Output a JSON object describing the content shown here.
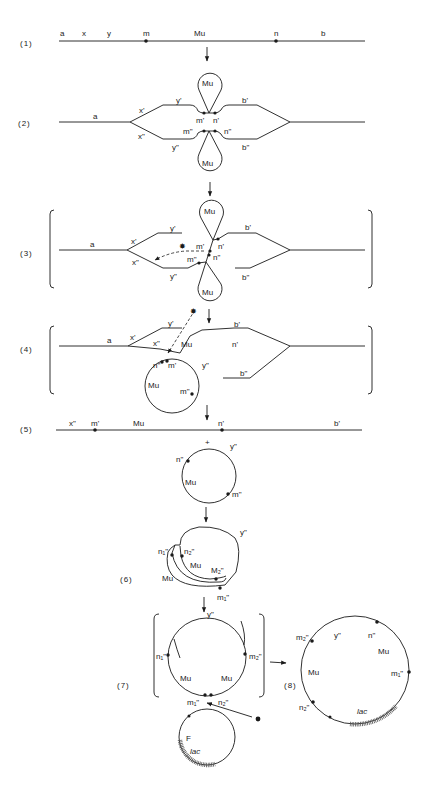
{
  "steps": {
    "s1": "(1)",
    "s2": "(2)",
    "s3": "(3)",
    "s4": "(4)",
    "s5": "(5)",
    "s6": "(6)",
    "s7": "(7)",
    "s8": "(8)"
  },
  "step1": {
    "labels": [
      "a",
      "x",
      "y",
      "m",
      "Mu",
      "n",
      "b"
    ]
  },
  "step2": {
    "mu": "Mu",
    "labels": {
      "a": "a",
      "x1": "x'",
      "y1": "y'",
      "b1": "b'",
      "m1": "m'",
      "n1": "n'",
      "x2": "x\"",
      "y2": "y\"",
      "m2": "m\"",
      "n2": "n\"",
      "b2": "b\""
    }
  },
  "step3": {
    "mu": "Mu",
    "star": "✸",
    "labels": {
      "a": "a",
      "x1": "x'",
      "y1": "y'",
      "b1": "b'",
      "m1": "m'",
      "n1": "n'",
      "x2": "x\"",
      "y2": "y\"",
      "m2": "m\"",
      "n2": "n\"",
      "b2": "b\""
    }
  },
  "step4": {
    "mu": "Mu",
    "star": "✸",
    "labels": {
      "a": "a",
      "x1": "x'",
      "y1": "y'",
      "x2": "x\"",
      "b1": "b'",
      "n1": "n'",
      "n2": "n\"",
      "m1": "m'",
      "y2": "y\"",
      "m2": "m\"",
      "b2": "b\"",
      "mu_circle": "Mu"
    }
  },
  "step5": {
    "line_labels": {
      "x2": "x\"",
      "m1": "m'",
      "mu": "Mu",
      "n1": "n'",
      "b1": "b'"
    },
    "plus": "+",
    "circle_labels": {
      "n2": "n\"",
      "y2": "y\"",
      "mu": "Mu",
      "m2": "m\""
    }
  },
  "step6": {
    "labels": {
      "y2": "y\"",
      "n1": "n₁\"",
      "n2": "n₂\"",
      "mu_inner": "Mu",
      "m2": "M₂\"",
      "mu_outer": "Mu",
      "m1": "m₁\""
    }
  },
  "step7": {
    "labels": {
      "y2": "y\"",
      "n1": "n₁\"",
      "m2": "m₂\"",
      "mu_left": "Mu",
      "mu_right": "Mu",
      "m1": "m₁\"",
      "n2": "n₂\""
    },
    "plasmid": {
      "f": "F",
      "lac": "lac"
    },
    "star": "✸"
  },
  "step8": {
    "labels": {
      "m2": "m₂\"",
      "y2": "y\"",
      "n": "n\"",
      "mu_right": "Mu",
      "mu_left": "Mu",
      "m1": "m₁\"",
      "n2": "n₂\"",
      "lac": "lac"
    }
  }
}
